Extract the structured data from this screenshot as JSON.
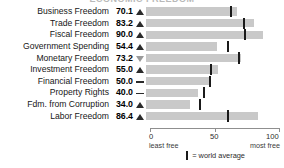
{
  "title": "ECONOMIC FREEDOM",
  "chart_data": {
    "type": "bar",
    "orientation": "horizontal",
    "title": "ECONOMIC FREEDOM",
    "xlabel": "",
    "ylabel": "",
    "xlim": [
      0,
      100
    ],
    "grid": false,
    "legend_position": "bottom",
    "axis_ticks": [
      "0",
      "50",
      "100"
    ],
    "axis_tick_values": [
      0,
      50,
      100
    ],
    "axis_caption_left": "least free",
    "axis_caption_right": "most free",
    "legend_label": "= world average",
    "bar_color": "#c9c9c9",
    "average_marker_color": "#1a1a1a",
    "categories": [
      "Business Freedom",
      "Trade Freedom",
      "Fiscal Freedom",
      "Government Spending",
      "Monetary Freedom",
      "Investment Freedom",
      "Financial Freedom",
      "Property Rights",
      "Fdm. from Corruption",
      "Labor Freedom"
    ],
    "values": [
      70.1,
      83.2,
      90.0,
      54.4,
      73.2,
      55.0,
      50.0,
      40.0,
      34.0,
      86.4
    ],
    "world_average": [
      64.3,
      74.5,
      75.4,
      62.0,
      70.6,
      48.9,
      48.5,
      43.8,
      40.5,
      62.1
    ],
    "trend": [
      "up",
      "up",
      "up",
      "up",
      "down",
      "up",
      "flat",
      "flat",
      "up",
      "up"
    ]
  },
  "rows": [
    {
      "label": "Business Freedom",
      "value": "70.1",
      "trend": "up",
      "bar": 70.1,
      "avg": 64.3
    },
    {
      "label": "Trade Freedom",
      "value": "83.2",
      "trend": "up",
      "bar": 83.2,
      "avg": 74.5
    },
    {
      "label": "Fiscal Freedom",
      "value": "90.0",
      "trend": "up",
      "bar": 90.0,
      "avg": 75.4
    },
    {
      "label": "Government Spending",
      "value": "54.4",
      "trend": "up",
      "bar": 54.4,
      "avg": 62.0
    },
    {
      "label": "Monetary Freedom",
      "value": "73.2",
      "trend": "down",
      "bar": 73.2,
      "avg": 70.6
    },
    {
      "label": "Investment Freedom",
      "value": "55.0",
      "trend": "up",
      "bar": 55.0,
      "avg": 48.9
    },
    {
      "label": "Financial Freedom",
      "value": "50.0",
      "trend": "flat",
      "bar": 50.0,
      "avg": 48.5
    },
    {
      "label": "Property Rights",
      "value": "40.0",
      "trend": "flat",
      "bar": 40.0,
      "avg": 43.8
    },
    {
      "label": "Fdm. from Corruption",
      "value": "34.0",
      "trend": "up",
      "bar": 34.0,
      "avg": 40.5
    },
    {
      "label": "Labor Freedom",
      "value": "86.4",
      "trend": "up",
      "bar": 86.4,
      "avg": 62.1
    }
  ],
  "axis": {
    "ticks": [
      "0",
      "50",
      "100"
    ],
    "left_caption": "least free",
    "right_caption": "most free"
  },
  "legend": {
    "label": "= world average"
  }
}
